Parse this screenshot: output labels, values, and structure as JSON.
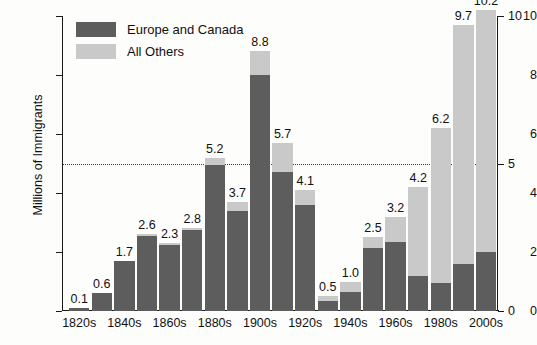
{
  "chart_data": {
    "type": "bar",
    "subtype": "stacked-bar",
    "title": "",
    "xlabel": "",
    "ylabel": "Millions of Immigrants",
    "ylim": [
      0,
      10
    ],
    "yticks_left": [
      0,
      2,
      4,
      6,
      8,
      10
    ],
    "yticks_right": [
      0,
      5,
      10
    ],
    "grid": false,
    "reference_line": 5,
    "legend_position": "top-left",
    "categories": [
      "1820s",
      "1830s",
      "1840s",
      "1850s",
      "1860s",
      "1870s",
      "1880s",
      "1890s",
      "1900s",
      "1910s",
      "1920s",
      "1930s",
      "1940s",
      "1950s",
      "1960s",
      "1970s",
      "1980s",
      "1990s",
      "2000s"
    ],
    "tick_labels": [
      "1820s",
      "1840s",
      "1860s",
      "1880s",
      "1900s",
      "1920s",
      "1940s",
      "1960s",
      "1980s",
      "2000s"
    ],
    "totals": [
      0.1,
      0.6,
      1.7,
      2.6,
      2.3,
      2.8,
      5.2,
      3.7,
      8.8,
      5.7,
      4.1,
      0.5,
      1.0,
      2.5,
      3.2,
      4.2,
      6.2,
      9.7,
      10.2
    ],
    "series": [
      {
        "name": "Europe and Canada",
        "color": "#5d5d5d",
        "values": [
          0.1,
          0.6,
          1.7,
          2.55,
          2.25,
          2.75,
          4.95,
          3.4,
          8.0,
          4.7,
          3.6,
          0.35,
          0.65,
          2.15,
          2.35,
          1.2,
          0.95,
          1.6,
          2.0
        ]
      },
      {
        "name": "All Others",
        "color": "#c9c9c9",
        "values": [
          0.0,
          0.0,
          0.0,
          0.05,
          0.05,
          0.05,
          0.25,
          0.3,
          0.8,
          1.0,
          0.5,
          0.15,
          0.35,
          0.35,
          0.85,
          3.0,
          5.25,
          8.1,
          8.2
        ]
      }
    ],
    "labeled_bars": [
      {
        "category": "1820s",
        "label": "0.1"
      },
      {
        "category": "1830s",
        "label": "0.6"
      },
      {
        "category": "1840s",
        "label": "1.7"
      },
      {
        "category": "1850s",
        "label": "2.6"
      },
      {
        "category": "1860s",
        "label": "2.3"
      },
      {
        "category": "1870s",
        "label": "2.8"
      },
      {
        "category": "1880s",
        "label": "5.2"
      },
      {
        "category": "1890s",
        "label": "3.7"
      },
      {
        "category": "1900s",
        "label": "8.8"
      },
      {
        "category": "1910s",
        "label": "5.7"
      },
      {
        "category": "1920s",
        "label": "4.1"
      },
      {
        "category": "1930s",
        "label": "0.5"
      },
      {
        "category": "1940s",
        "label": "1.0"
      },
      {
        "category": "1950s",
        "label": "2.5"
      },
      {
        "category": "1960s",
        "label": "3.2"
      },
      {
        "category": "1970s",
        "label": "4.2"
      },
      {
        "category": "1980s",
        "label": "6.2"
      },
      {
        "category": "1990s",
        "label": "9.7"
      },
      {
        "category": "2000s",
        "label": "10.2"
      }
    ]
  },
  "legend": {
    "items": [
      {
        "label": "Europe and Canada",
        "color": "#5d5d5d"
      },
      {
        "label": "All Others",
        "color": "#c9c9c9"
      }
    ]
  },
  "colors": {
    "europe_and_canada": "#5d5d5d",
    "all_others": "#c9c9c9",
    "axis": "#1a1a1a",
    "background": "#fdfdfb"
  }
}
